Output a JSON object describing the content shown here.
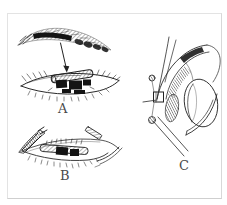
{
  "figure": {
    "labels": {
      "panel_a": "A",
      "panel_b": "B",
      "panel_c": "C"
    },
    "colors": {
      "background": "#ffffff",
      "frame_border": "#e3e3e3",
      "ink": "#2a2a2a",
      "label_text": "#4a4a4a"
    }
  }
}
